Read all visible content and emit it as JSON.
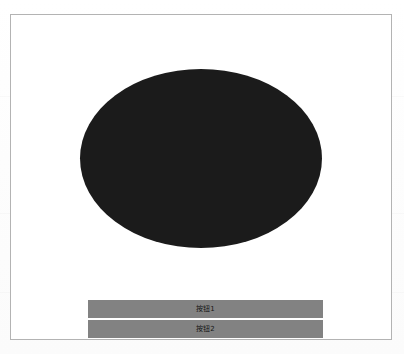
{
  "window": {
    "frame_border_color": "#b3b3b3",
    "background_color": "#ffffff",
    "page_background_color": "#fdfdfd"
  },
  "canvas": {
    "shape": {
      "name": "ellipse",
      "fill_color": "#1b1b1b",
      "width_px": 242,
      "height_px": 179
    }
  },
  "buttons": [
    {
      "label": "按钮1",
      "background_color": "#828282",
      "text_color": "#151515"
    },
    {
      "label": "按钮2",
      "background_color": "#828282",
      "text_color": "#151515"
    }
  ]
}
